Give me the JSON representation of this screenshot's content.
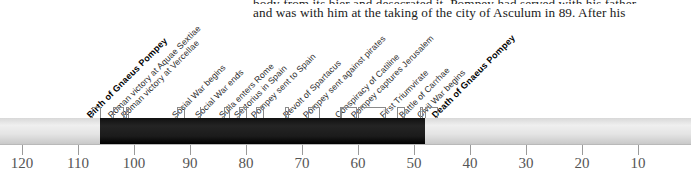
{
  "document": {
    "body_text_lines": [
      "body from its bier and desecrated it. Pompey had served with his father",
      "and was with him at the taking of the city of Asculum in 89. After his"
    ]
  },
  "chart_data": {
    "type": "timeline",
    "title": "",
    "xlabel": "",
    "ylabel": "",
    "grid": false,
    "legend": null,
    "axis": {
      "orientation": "horizontal",
      "direction": "descending",
      "unit": "BC",
      "range": [
        125,
        5
      ],
      "tick_values": [
        120,
        110,
        100,
        90,
        80,
        70,
        60,
        50,
        40,
        30,
        20,
        10
      ],
      "tick_labels": [
        "120",
        "110",
        "100",
        "90",
        "80",
        "70",
        "60",
        "50",
        "40",
        "30",
        "20",
        "10"
      ]
    },
    "span": {
      "label": "Lifespan of Gnaeus Pompey",
      "start_year": 106,
      "end_year": 48,
      "fill_color": "#151515",
      "track_color": "#e4e4e4"
    },
    "events": [
      {
        "label": "Birth of Gnaeus Pompey",
        "year": 106,
        "emphasis": true
      },
      {
        "label": "Roman victory at Aquae Sextiae",
        "year": 102,
        "emphasis": false
      },
      {
        "label": "Roman victory at Vercellae",
        "year": 101,
        "emphasis": false
      },
      {
        "label": "Social War begins",
        "year": 91,
        "emphasis": false
      },
      {
        "label": "Social War ends",
        "year": 88,
        "emphasis": false
      },
      {
        "label": "Sulla enters Rome",
        "year": 83,
        "emphasis": false
      },
      {
        "label": "Sertorius in Spain",
        "year": 80,
        "emphasis": false
      },
      {
        "label": "Pompey sent to Spain",
        "year": 77,
        "emphasis": false
      },
      {
        "label": "Revolt of Spartacus",
        "year": 73,
        "emphasis": false
      },
      {
        "label": "Pompey sent against pirates",
        "year": 67,
        "emphasis": false
      },
      {
        "label": "Conspiracy of Catiline",
        "year": 63,
        "emphasis": false
      },
      {
        "label": "Pompey captures Jerusalem",
        "year": 63,
        "emphasis": false
      },
      {
        "label": "First Triumvirate",
        "year": 60,
        "emphasis": false
      },
      {
        "label": "Battle of Carrhae",
        "year": 53,
        "emphasis": false
      },
      {
        "label": "Civil War begins",
        "year": 49,
        "emphasis": false
      },
      {
        "label": "Death of Gnaeus Pompey",
        "year": 48,
        "emphasis": true
      }
    ]
  }
}
